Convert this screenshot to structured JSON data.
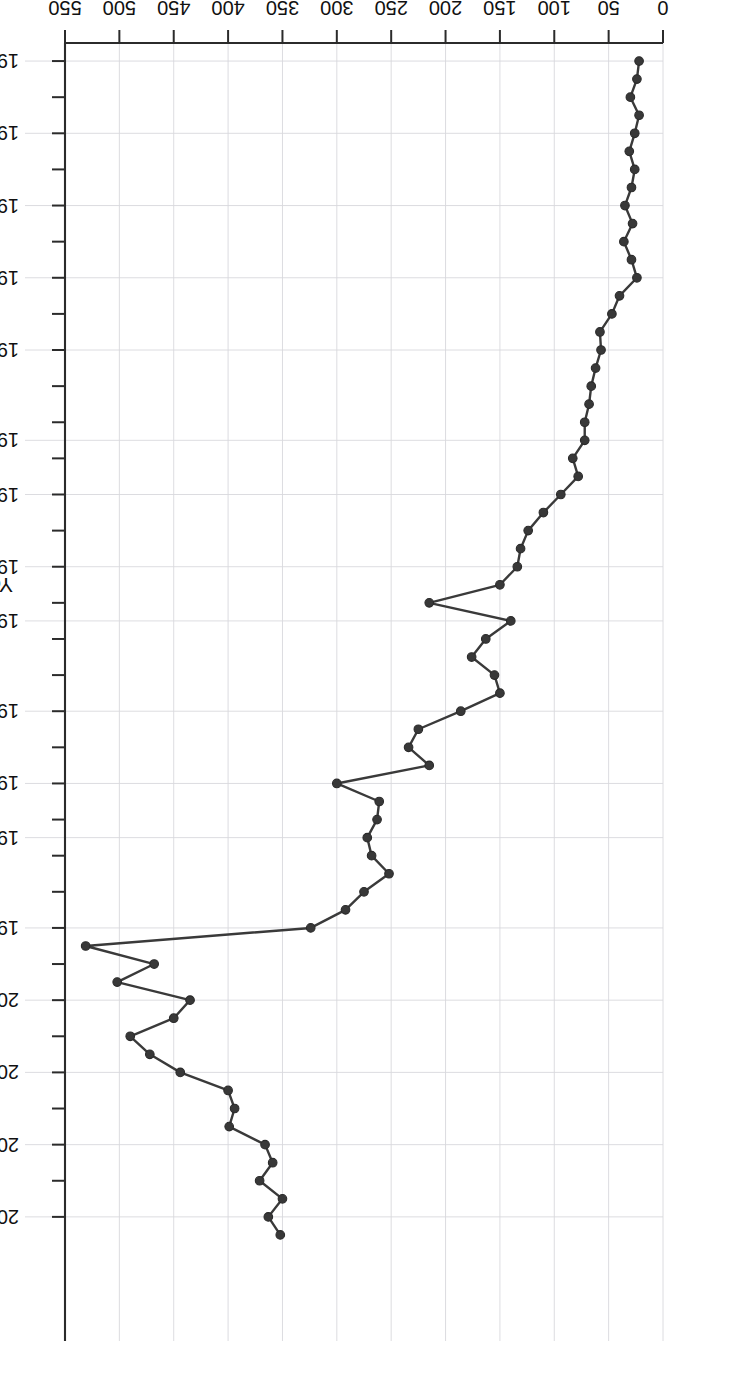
{
  "figure": {
    "rotation_degrees": 180,
    "background": "#ffffff",
    "line_color": "#3a3a3a",
    "marker_color": "#383838",
    "grid_color": "#d8d8dc"
  },
  "chart_data": {
    "type": "line",
    "title": "",
    "subtitle": "",
    "xlabel": "Year",
    "ylabel": "Number of disasters per continent",
    "xlim": [
      1949,
      2016
    ],
    "ylim": [
      0,
      550
    ],
    "grid": true,
    "legend": null,
    "markers": "filled circles",
    "x_tick_labels": [
      "1950",
      "1954",
      "1958",
      "1962",
      "1966",
      "1971",
      "1974",
      "1978",
      "1981",
      "1986",
      "1990",
      "1993",
      "1998",
      "2002",
      "2006",
      "2010",
      "2014"
    ],
    "y_tick_labels": [
      "0",
      "50",
      "100",
      "150",
      "200",
      "250",
      "300",
      "350",
      "400",
      "450",
      "500",
      "550"
    ],
    "y_ticks": [
      0,
      50,
      100,
      150,
      200,
      250,
      300,
      350,
      400,
      450,
      500,
      550
    ],
    "x": [
      1950,
      1951,
      1952,
      1953,
      1954,
      1955,
      1956,
      1957,
      1958,
      1959,
      1960,
      1961,
      1962,
      1963,
      1964,
      1965,
      1966,
      1967,
      1968,
      1969,
      1970,
      1971,
      1972,
      1973,
      1974,
      1975,
      1976,
      1977,
      1978,
      1979,
      1980,
      1981,
      1982,
      1983,
      1984,
      1985,
      1986,
      1987,
      1988,
      1989,
      1990,
      1991,
      1992,
      1993,
      1994,
      1995,
      1996,
      1997,
      1998,
      1999,
      2000,
      2001,
      2002,
      2003,
      2004,
      2005,
      2006,
      2007,
      2008,
      2009,
      2010,
      2011,
      2012,
      2013,
      2014,
      2015
    ],
    "values": [
      22,
      24,
      30,
      22,
      26,
      31,
      26,
      29,
      35,
      28,
      36,
      29,
      24,
      40,
      47,
      58,
      57,
      62,
      66,
      68,
      72,
      72,
      83,
      78,
      94,
      110,
      124,
      131,
      134,
      150,
      215,
      140,
      163,
      176,
      155,
      150,
      186,
      225,
      234,
      215,
      300,
      261,
      263,
      272,
      268,
      252,
      275,
      292,
      324,
      531,
      468,
      502,
      435,
      450,
      490,
      472,
      444,
      400,
      394,
      399,
      366,
      359,
      371,
      350,
      363,
      352
    ],
    "series": [
      {
        "name": "Number of disasters per continent",
        "values": [
          22,
          24,
          30,
          22,
          26,
          31,
          26,
          29,
          35,
          28,
          36,
          29,
          24,
          40,
          47,
          58,
          57,
          62,
          66,
          68,
          72,
          72,
          83,
          78,
          94,
          110,
          124,
          131,
          134,
          150,
          215,
          140,
          163,
          176,
          155,
          150,
          186,
          225,
          234,
          215,
          300,
          261,
          263,
          272,
          268,
          252,
          275,
          292,
          324,
          531,
          468,
          502,
          435,
          450,
          490,
          472,
          444,
          400,
          394,
          399,
          366,
          359,
          371,
          350,
          363,
          352
        ]
      }
    ],
    "annotations": []
  }
}
